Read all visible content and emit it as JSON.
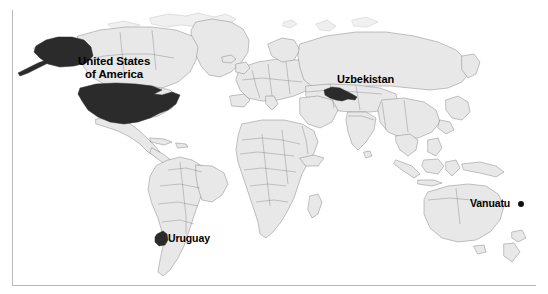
{
  "figure": {
    "type": "world-map",
    "projection": "equirectangular",
    "width": 548,
    "height": 294,
    "background_color": "#ffffff",
    "land_fill_color": "#e8e8e8",
    "land_border_color": "#6f6f6f",
    "highlight_fill_color": "#2b2b2b",
    "frame_line_color": "#b9b9b9"
  },
  "labels": {
    "usa_line1": "United States",
    "usa_line2": "of America",
    "uzbekistan": "Uzbekistan",
    "uruguay": "Uruguay",
    "vanuatu": "Vanuatu"
  },
  "highlighted_countries": [
    {
      "name": "United States of America",
      "label": "United States of America",
      "fill": "#2b2b2b",
      "marker": "filled-region",
      "region": "North America"
    },
    {
      "name": "Uzbekistan",
      "label": "Uzbekistan",
      "fill": "#2b2b2b",
      "marker": "filled-region",
      "region": "Central Asia"
    },
    {
      "name": "Uruguay",
      "label": "Uruguay",
      "fill": "#2b2b2b",
      "marker": "filled-region",
      "region": "South America"
    },
    {
      "name": "Vanuatu",
      "label": "Vanuatu",
      "fill": "#111111",
      "marker": "dot",
      "region": "Oceania"
    }
  ]
}
